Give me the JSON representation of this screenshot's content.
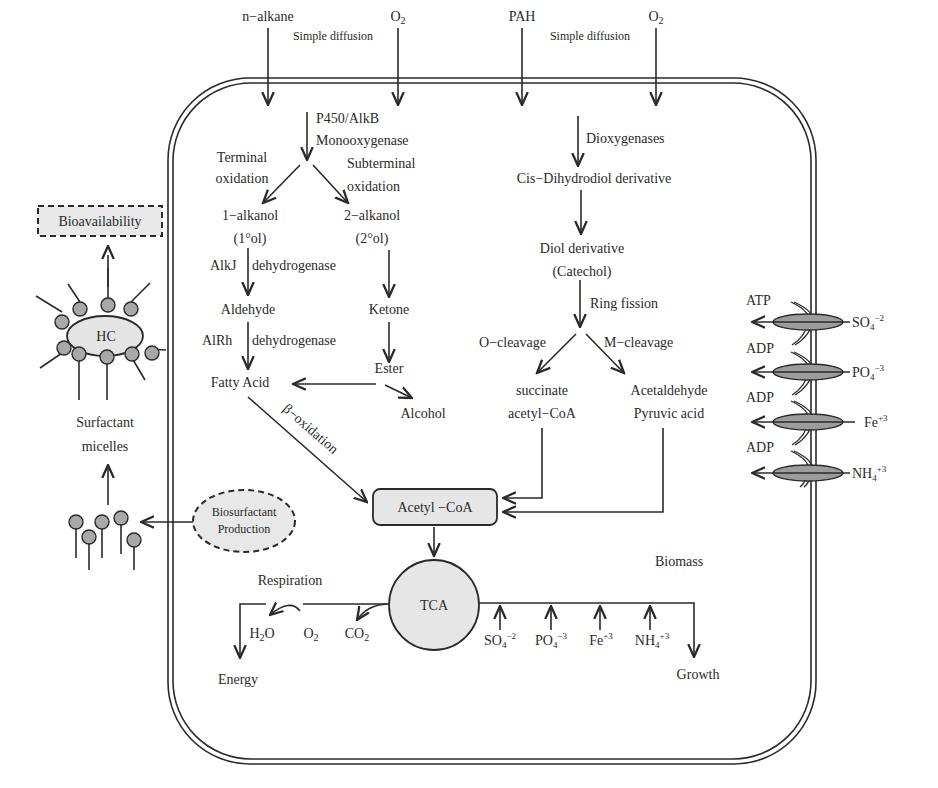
{
  "diagram": {
    "colors": {
      "line": "#2a2a2a",
      "node_fill": "#e6e6e6",
      "bead_fill": "#a8a8a8",
      "background": "#ffffff"
    },
    "uptake": {
      "alkane_input": "n−alkane",
      "o2_input_left": "O",
      "o2_sub": "2",
      "diffusion_left": "Simple diffusion",
      "pah_input": "PAH",
      "o2_input_right": "O",
      "diffusion_right": "Simple diffusion"
    },
    "alkane_pathway": {
      "enzyme_line1": "P450/AlkB",
      "enzyme_line2": "Monooxygenase",
      "terminal_line1": "Terminal",
      "terminal_line2": "oxidation",
      "subterminal_line1": "Subterminal",
      "subterminal_line2": "oxidation",
      "alkanol1": "1−alkanol",
      "alkanol1_sub": "(1°ol)",
      "alkanol2": "2−alkanol",
      "alkanol2_sub": "(2°ol)",
      "alkj_enzyme": "AlkJ",
      "alkj_dehydrogenase": "dehydrogenase",
      "aldehyde": "Aldehyde",
      "alrh_enzyme": "AlRh",
      "alrh_dehydrogenase": "dehydrogenase",
      "ketone": "Ketone",
      "ester": "Ester",
      "fatty_acid": "Fatty Acid",
      "alcohol": "Alcohol",
      "beta_oxidation": "β−oxidation"
    },
    "pah_pathway": {
      "enzyme": "Dioxygenases",
      "cis_dihydrodiol": "Cis−Dihydrodiol derivative",
      "diol_line1": "Diol derivative",
      "diol_line2": "(Catechol)",
      "ring_fission": "Ring fission",
      "o_cleavage": "O−cleavage",
      "m_cleavage": "M−cleavage",
      "succinate_line1": "succinate",
      "succinate_line2": "acetyl−CoA",
      "acetaldehyde_line1": "Acetaldehyde",
      "acetaldehyde_line2": "Pyruvic acid"
    },
    "central": {
      "acetyl_coa": "Acetyl  −CoA",
      "tca": "TCA",
      "respiration": "Respiration",
      "h2o_h": "H",
      "h2o_sub": "2",
      "h2o_o": "O",
      "o2": "O",
      "o2_sub": "2",
      "co2": "CO",
      "co2_sub": "2",
      "energy": "Energy",
      "biomass_line1": "Biomass",
      "biomass_line2": "Synthesis",
      "growth": "Growth"
    },
    "nutrients_inside": [
      {
        "base": "SO",
        "sub": "4",
        "sup": "−2"
      },
      {
        "base": "PO",
        "sub": "4",
        "sup": "−3"
      },
      {
        "base": "Fe",
        "sub": "",
        "sup": "+3"
      },
      {
        "base": "NH",
        "sub": "4",
        "sup": "+3"
      }
    ],
    "transporters": {
      "atp": "ATP",
      "adp1": "ADP",
      "adp2": "ADP",
      "adp3": "ADP",
      "ions": [
        {
          "base": "SO",
          "sub": "4",
          "sup": "−2"
        },
        {
          "base": "PO",
          "sub": "4",
          "sup": "−3"
        },
        {
          "base": "Fe",
          "sub": "",
          "sup": "+3"
        },
        {
          "base": "NH",
          "sub": "4",
          "sup": "+3"
        }
      ]
    },
    "extracellular": {
      "bioavailability": "Bioavailability",
      "hc": "HC",
      "surfactant_line1": "Surfactant",
      "surfactant_line2": "micelles",
      "biosurfactant_line1": "Biosurfactant",
      "biosurfactant_line2": "Production"
    }
  }
}
